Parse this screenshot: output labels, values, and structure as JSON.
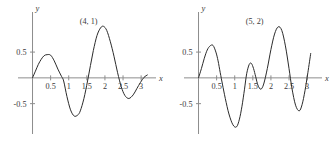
{
  "figure": {
    "background_color": "#ffffff",
    "axis_color": "#8d8d8d",
    "curve_color": "#2b2b2b",
    "text_color": "#3b3b3b"
  },
  "chart_data": [
    {
      "type": "line",
      "title": "",
      "annotation": "(4, 1)",
      "xlabel": "x",
      "ylabel": "y",
      "xlim": [
        -0.18,
        3.3
      ],
      "ylim": [
        -1.05,
        1.2
      ],
      "grid": false,
      "legend": "none",
      "xticks": [
        0.5,
        1,
        1.5,
        2,
        2.5,
        3
      ],
      "xticklabels": [
        "0.5",
        "1",
        "1.5",
        "2",
        "2.5",
        "3"
      ],
      "yticks": [
        0.5,
        -0.5
      ],
      "yticklabels": [
        "0.5",
        "-0.5"
      ],
      "x": [
        0.0,
        0.08,
        0.16,
        0.24,
        0.32,
        0.4,
        0.5,
        0.6,
        0.7,
        0.8,
        0.86,
        0.95,
        1.05,
        1.15,
        1.25,
        1.32,
        1.42,
        1.52,
        1.6,
        1.68,
        1.78,
        1.88,
        1.96,
        2.05,
        2.15,
        2.25,
        2.35,
        2.45,
        2.55,
        2.66,
        2.78,
        2.88,
        2.98,
        3.08,
        3.18
      ],
      "y": [
        0.0,
        0.13,
        0.26,
        0.36,
        0.43,
        0.45,
        0.44,
        0.33,
        0.17,
        0.03,
        -0.06,
        -0.36,
        -0.62,
        -0.74,
        -0.72,
        -0.64,
        -0.4,
        -0.06,
        0.24,
        0.53,
        0.82,
        0.97,
        1.0,
        0.92,
        0.7,
        0.42,
        0.1,
        -0.17,
        -0.34,
        -0.4,
        -0.33,
        -0.21,
        -0.09,
        0.01,
        0.06
      ]
    },
    {
      "type": "line",
      "title": "",
      "annotation": "(5, 2)",
      "xlabel": "x",
      "ylabel": "y",
      "xlim": [
        -0.18,
        3.3
      ],
      "ylim": [
        -1.05,
        1.2
      ],
      "grid": false,
      "legend": "none",
      "xticks": [
        0.5,
        1,
        1.5,
        2,
        2.5,
        3
      ],
      "xticklabels": [
        "0.5",
        "1",
        "1.5",
        "2",
        "2.5",
        "3"
      ],
      "yticks": [
        0.5,
        -0.5
      ],
      "yticklabels": [
        "0.5",
        "-0.5"
      ],
      "x": [
        0.0,
        0.08,
        0.16,
        0.24,
        0.32,
        0.4,
        0.48,
        0.54,
        0.6,
        0.66,
        0.74,
        0.84,
        0.95,
        1.05,
        1.13,
        1.2,
        1.27,
        1.33,
        1.4,
        1.46,
        1.52,
        1.58,
        1.64,
        1.72,
        1.8,
        1.9,
        2.0,
        2.1,
        2.2,
        2.3,
        2.4,
        2.5,
        2.58,
        2.68,
        2.78,
        2.86,
        2.94,
        3.02,
        3.1
      ],
      "y": [
        0.0,
        0.18,
        0.38,
        0.54,
        0.62,
        0.63,
        0.5,
        0.33,
        0.1,
        -0.12,
        -0.4,
        -0.7,
        -0.91,
        -0.95,
        -0.8,
        -0.55,
        -0.22,
        0.08,
        0.26,
        0.28,
        0.18,
        0.02,
        -0.14,
        -0.22,
        -0.12,
        0.18,
        0.55,
        0.85,
        0.99,
        0.92,
        0.62,
        0.18,
        -0.2,
        -0.53,
        -0.64,
        -0.52,
        -0.25,
        0.1,
        0.48
      ]
    }
  ]
}
